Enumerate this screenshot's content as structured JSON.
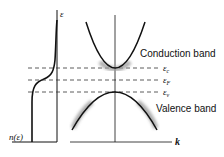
{
  "diagram": {
    "dos_plot": {
      "y_axis_label": "ε",
      "x_axis_label": "n(ε)"
    },
    "band_plot": {
      "x_axis_label": "k",
      "conduction_label": "Conduction band",
      "valence_label": "Valence band"
    },
    "levels": [
      {
        "name": "conduction-band-edge",
        "symbol": "ε",
        "subscript": "c"
      },
      {
        "name": "fermi-level",
        "symbol": "ε",
        "subscript": "F"
      },
      {
        "name": "valence-band-edge",
        "symbol": "ε",
        "subscript": "v"
      }
    ],
    "colors": {
      "line": "#111111",
      "highlight": "#9a9a9a",
      "background": "#ffffff"
    }
  }
}
